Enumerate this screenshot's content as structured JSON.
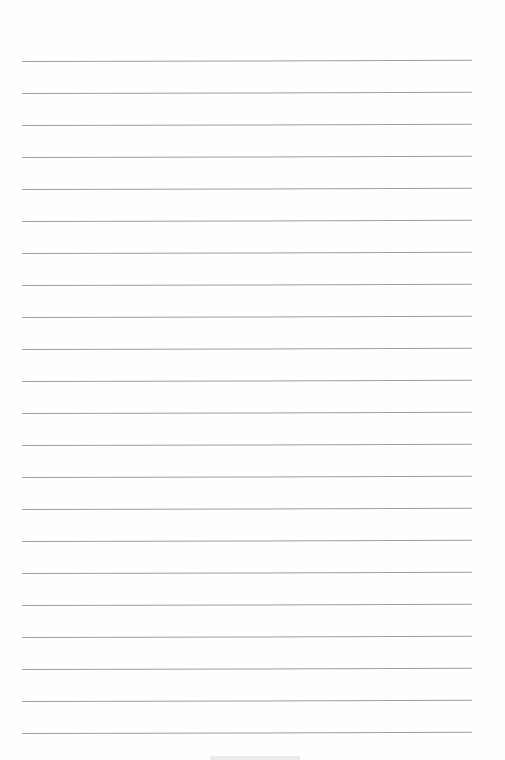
{
  "page": {
    "type": "lined paper",
    "line_count": 22,
    "first_line_y": 61,
    "line_spacing": 32,
    "line_left": 22,
    "line_width": 450,
    "line_color": "#9d9d9d",
    "background": "#fefefe"
  }
}
